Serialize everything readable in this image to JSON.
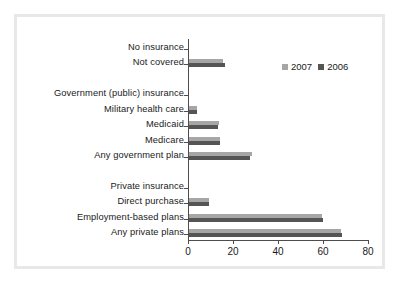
{
  "chart_data": {
    "type": "bar",
    "orientation": "horizontal",
    "title": "",
    "subtitle": "",
    "xlabel": "",
    "ylabel": "",
    "xlim": [
      0,
      80
    ],
    "xticks": [
      0,
      20,
      40,
      60,
      80
    ],
    "xticklabels": [
      "0",
      "20",
      "40",
      "60",
      "80"
    ],
    "grid": false,
    "legend": {
      "position": "top-right",
      "entries": [
        {
          "name": "2007",
          "color": "#a6a6a6"
        },
        {
          "name": "2006",
          "color": "#555555"
        }
      ]
    },
    "categories": [
      "No insurance",
      "Not covered",
      "",
      "Government (public) insurance",
      "Military health care",
      "Medicaid",
      "Medicare",
      "Any government plan",
      "",
      "Private insurance",
      "Direct purchase",
      "Employment-based plans",
      "Any private plans"
    ],
    "series": [
      {
        "name": "2007",
        "color": "#a6a6a6",
        "values": [
          null,
          15.3,
          null,
          null,
          3.7,
          13.2,
          13.8,
          27.8,
          null,
          null,
          8.9,
          59.3,
          67.5
        ]
      },
      {
        "name": "2006",
        "color": "#555555",
        "values": [
          null,
          15.8,
          null,
          null,
          3.6,
          12.9,
          13.6,
          27.0,
          null,
          null,
          9.1,
          59.7,
          67.9
        ]
      }
    ]
  },
  "axis": {
    "x_tick_labels": [
      "0",
      "20",
      "40",
      "60",
      "80"
    ]
  },
  "legend": {
    "series_2007_label": "2007",
    "series_2006_label": "2006"
  },
  "colors": {
    "series_2007": "#a6a6a6",
    "series_2006": "#555555",
    "axis": "#4d4d4d",
    "frame": "#e8e8e8",
    "text": "#1a1a1a",
    "background": "#ffffff"
  }
}
